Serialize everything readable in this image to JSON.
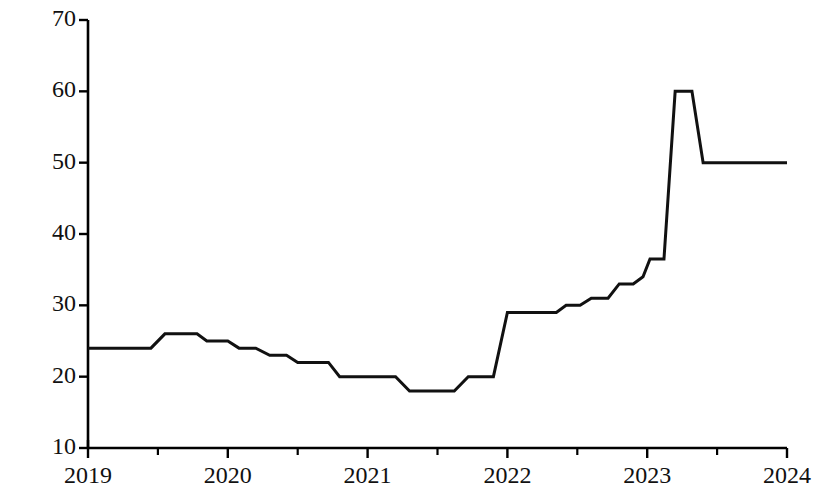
{
  "chart_data": {
    "type": "line",
    "title": "",
    "xlabel": "",
    "ylabel": "价格（元/千克）",
    "xlim": [
      2019,
      2024
    ],
    "ylim": [
      10,
      70
    ],
    "y_ticks": [
      10,
      20,
      30,
      40,
      50,
      60,
      70
    ],
    "x_ticks": [
      2019,
      2020,
      2021,
      2022,
      2023,
      2024
    ],
    "x_minor_ticks": [
      2019.5,
      2020.5,
      2021.5,
      2022.5,
      2023.5
    ],
    "grid": false,
    "legend": null,
    "line_color": "#111111",
    "line_width": 3,
    "step_style": "piecewise-linear",
    "series": [
      {
        "name": "价格",
        "x": [
          2019.0,
          2019.45,
          2019.55,
          2019.78,
          2019.85,
          2020.0,
          2020.08,
          2020.2,
          2020.3,
          2020.42,
          2020.5,
          2020.72,
          2020.8,
          2021.2,
          2021.3,
          2021.62,
          2021.72,
          2021.9,
          2022.0,
          2022.35,
          2022.42,
          2022.52,
          2022.6,
          2022.72,
          2022.8,
          2022.9,
          2022.97,
          2023.02,
          2023.12,
          2023.2,
          2023.32,
          2023.4,
          2024.0
        ],
        "y": [
          24,
          24,
          26,
          26,
          25,
          25,
          24,
          24,
          23,
          23,
          22,
          22,
          20,
          20,
          18,
          18,
          20,
          20,
          29,
          29,
          30,
          30,
          31,
          31,
          33,
          33,
          34,
          36.5,
          36.5,
          60,
          60,
          50,
          50
        ]
      }
    ],
    "annotations": [],
    "key_values": {
      "start_value": 24,
      "first_peak": 26,
      "trough": 18,
      "max_peak": 60,
      "end_value": 50
    }
  },
  "axis": {
    "y_tick_labels": [
      "70",
      "60",
      "50",
      "40",
      "30",
      "20",
      "10"
    ],
    "x_tick_labels": [
      "2019",
      "2020",
      "2021",
      "2022",
      "2023",
      "2024"
    ]
  },
  "colors": {
    "line": "#111111",
    "axis": "#000000",
    "background": "#ffffff",
    "text": "#111111"
  }
}
